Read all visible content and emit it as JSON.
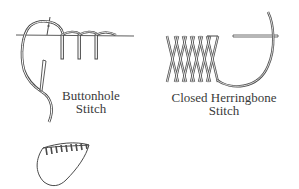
{
  "diagram": {
    "type": "stitch-illustrations",
    "colors": {
      "line": "#4a4a4a",
      "thread_fill": "#ffffff",
      "text": "#3a3a3a",
      "background": "#ffffff"
    },
    "figures": [
      {
        "id": "buttonhole",
        "label_line1": "Buttonhole",
        "label_line2": "Stitch"
      },
      {
        "id": "closed-herringbone",
        "label_line1": "Closed Herringbone",
        "label_line2": "Stitch"
      },
      {
        "id": "scalloped-edge",
        "label_line1": "",
        "label_line2": ""
      }
    ]
  }
}
